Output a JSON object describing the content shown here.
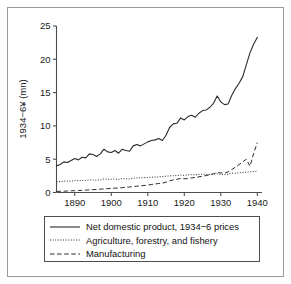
{
  "figure": {
    "background_color": "#ffffff",
    "frame_color": "#9a9a9a",
    "line_color": "#2b2b2b"
  },
  "legend": {
    "entries": [
      {
        "label": "Net domestic product, 1934−6 prices",
        "style": "solid",
        "icon": "solid-line-icon"
      },
      {
        "label": "Agriculture, forestry, and fishery",
        "style": "dotted",
        "icon": "dotted-line-icon"
      },
      {
        "label": "Manufacturing",
        "style": "dashed",
        "icon": "dashed-line-icon"
      }
    ]
  },
  "axes": {
    "y_title": "1934−6¥ (mn)",
    "y_ticks": [
      "0",
      "5",
      "10",
      "15",
      "20",
      "25"
    ],
    "x_ticks": [
      "1890",
      "1900",
      "1910",
      "1920",
      "1930",
      "1940"
    ]
  },
  "chart_data": {
    "type": "line",
    "title": "",
    "xlabel": "",
    "ylabel": "1934−6¥ (mn)",
    "xlim": [
      1885,
      1941
    ],
    "ylim": [
      0,
      25
    ],
    "grid": false,
    "legend_position": "below-plot",
    "x_ticks": [
      1890,
      1900,
      1910,
      1920,
      1930,
      1940
    ],
    "y_ticks": [
      0,
      5,
      10,
      15,
      20,
      25
    ],
    "x": [
      1885,
      1886,
      1887,
      1888,
      1889,
      1890,
      1891,
      1892,
      1893,
      1894,
      1895,
      1896,
      1897,
      1898,
      1899,
      1900,
      1901,
      1902,
      1903,
      1904,
      1905,
      1906,
      1907,
      1908,
      1909,
      1910,
      1911,
      1912,
      1913,
      1914,
      1915,
      1916,
      1917,
      1918,
      1919,
      1920,
      1921,
      1922,
      1923,
      1924,
      1925,
      1926,
      1927,
      1928,
      1929,
      1930,
      1931,
      1932,
      1933,
      1934,
      1935,
      1936,
      1937,
      1938,
      1939,
      1940
    ],
    "series": [
      {
        "name": "Net domestic product, 1934−6 prices",
        "style": "solid",
        "values": [
          4.0,
          4.2,
          4.6,
          4.5,
          4.8,
          5.1,
          4.9,
          5.3,
          5.2,
          5.8,
          5.7,
          5.4,
          5.8,
          6.5,
          6.1,
          6.0,
          6.3,
          5.9,
          6.5,
          6.3,
          6.2,
          7.0,
          7.2,
          7.0,
          7.3,
          7.6,
          7.8,
          7.9,
          8.1,
          7.8,
          8.6,
          9.8,
          10.3,
          10.4,
          11.2,
          10.9,
          11.4,
          11.6,
          11.3,
          11.9,
          12.3,
          12.4,
          12.8,
          13.4,
          14.5,
          13.6,
          13.2,
          13.3,
          14.6,
          15.6,
          16.4,
          17.4,
          19.2,
          21.0,
          22.3,
          23.3
        ]
      },
      {
        "name": "Agriculture, forestry, and fishery",
        "style": "dotted",
        "values": [
          1.6,
          1.65,
          1.7,
          1.72,
          1.68,
          1.8,
          1.78,
          1.82,
          1.8,
          1.9,
          1.88,
          1.84,
          1.9,
          2.05,
          1.98,
          2.0,
          2.05,
          1.95,
          2.1,
          2.05,
          2.02,
          2.15,
          2.18,
          2.2,
          2.22,
          2.25,
          2.3,
          2.32,
          2.35,
          2.38,
          2.45,
          2.5,
          2.52,
          2.55,
          2.62,
          2.58,
          2.65,
          2.68,
          2.66,
          2.7,
          2.75,
          2.72,
          2.7,
          2.78,
          2.8,
          2.72,
          2.68,
          2.75,
          2.9,
          2.88,
          2.95,
          3.0,
          3.05,
          3.1,
          3.15,
          3.2
        ]
      },
      {
        "name": "Manufacturing",
        "style": "dashed",
        "values": [
          0.15,
          0.18,
          0.2,
          0.22,
          0.25,
          0.28,
          0.3,
          0.33,
          0.35,
          0.4,
          0.42,
          0.45,
          0.5,
          0.55,
          0.58,
          0.62,
          0.65,
          0.68,
          0.72,
          0.78,
          0.82,
          0.9,
          0.95,
          1.0,
          1.05,
          1.12,
          1.2,
          1.28,
          1.35,
          1.4,
          1.55,
          1.75,
          1.9,
          2.0,
          2.1,
          2.05,
          2.1,
          2.2,
          2.25,
          2.35,
          2.45,
          2.55,
          2.65,
          2.8,
          3.0,
          2.95,
          2.9,
          3.1,
          3.45,
          3.8,
          4.2,
          4.6,
          5.0,
          3.95,
          5.9,
          7.5
        ]
      }
    ]
  }
}
